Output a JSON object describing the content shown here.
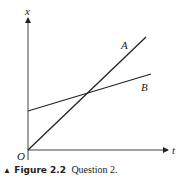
{
  "figure": {
    "axis_labels": {
      "y": "x",
      "x": "t",
      "origin": "O"
    },
    "lines": [
      {
        "label": "A",
        "from": [
          28,
          150
        ],
        "to": [
          146,
          37
        ],
        "label_pos": [
          122,
          48
        ]
      },
      {
        "label": "B",
        "from": [
          28,
          111
        ],
        "to": [
          151,
          74
        ],
        "label_pos": [
          141,
          91
        ]
      }
    ],
    "line_color": "#222222"
  },
  "caption": {
    "marker": "▲",
    "figure_label": "Figure 2.2",
    "text": "Question 2."
  }
}
